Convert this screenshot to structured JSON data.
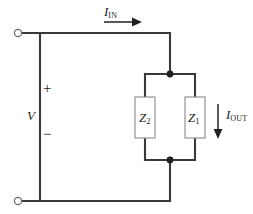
{
  "figure": {
    "type": "schematic",
    "background_color": "#ffffff",
    "wire_color": "#3a3a3c",
    "component_outline_color": "#8a8a8d",
    "text_color": "#231f20"
  },
  "labels": {
    "current_in": {
      "symbol": "I",
      "subscript": "IN"
    },
    "current_out": {
      "symbol": "I",
      "subscript": "OUT"
    },
    "voltage": {
      "symbol": "V"
    },
    "polarity_positive": "+",
    "polarity_negative": "−",
    "impedance_left": {
      "symbol": "Z",
      "subscript": "2"
    },
    "impedance_right": {
      "symbol": "Z",
      "subscript": "1"
    }
  },
  "components": {
    "terminal_top": {
      "name": "input-terminal-positive",
      "shape": "open-circle"
    },
    "terminal_bottom": {
      "name": "input-terminal-negative",
      "shape": "open-circle"
    },
    "node_top": {
      "name": "parallel-node-top",
      "shape": "filled-dot"
    },
    "node_bottom": {
      "name": "parallel-node-bottom",
      "shape": "filled-dot"
    },
    "box_left": {
      "name": "impedance-z2",
      "shape": "rectangle"
    },
    "box_right": {
      "name": "impedance-z1",
      "shape": "rectangle"
    }
  },
  "arrows": {
    "current_in": {
      "direction": "right"
    },
    "current_out": {
      "direction": "down"
    }
  }
}
